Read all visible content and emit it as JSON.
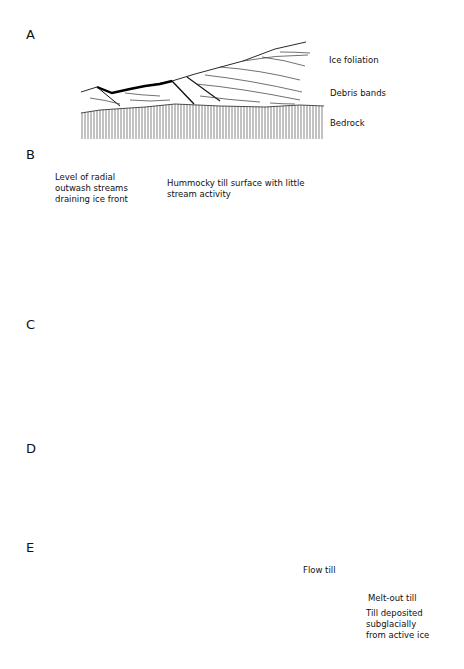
{
  "figure": {
    "panels": [
      {
        "id": "A",
        "letter": "A",
        "labels": {
          "ice_foliation": "Ice foliation",
          "debris_bands": "Debris bands",
          "bedrock": "Bedrock"
        }
      },
      {
        "id": "B",
        "letter": "B",
        "labels": {
          "level_line1": "Level of radial",
          "level_line2": "outwash streams",
          "level_line3": "draining ice front",
          "hummocky_line1": "Hummocky till surface with little",
          "hummocky_line2": "stream activity"
        }
      },
      {
        "id": "C",
        "letter": "C",
        "labels": {}
      },
      {
        "id": "D",
        "letter": "D",
        "labels": {}
      },
      {
        "id": "E",
        "letter": "E",
        "labels": {
          "flow_till": "Flow till",
          "meltout_till": "Melt-out till",
          "subglacial_line1": "Till deposited",
          "subglacial_line2": "subglacially",
          "subglacial_line3": "from active ice"
        }
      }
    ],
    "colors": {
      "ink": "#111111",
      "background": "#ffffff",
      "stipple": "#bdbdbd"
    }
  }
}
